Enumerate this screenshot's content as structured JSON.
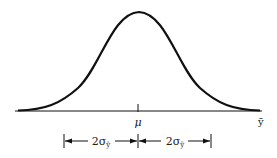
{
  "diagram": {
    "type": "normal-distribution-curve",
    "mean_label": "μ",
    "axis_label": "ȳ",
    "interval_left_label": "2σ",
    "interval_right_label": "2σ",
    "sigma_subscript": "ȳ",
    "colors": {
      "line": "#111111",
      "background": "#ffffff"
    }
  }
}
